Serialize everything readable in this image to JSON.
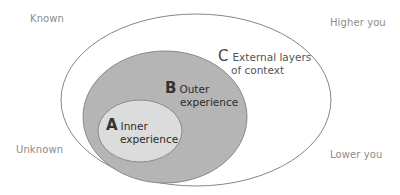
{
  "diagram": {
    "type": "nested-ellipses",
    "colors": {
      "outer_fill": "#ffffff",
      "outer_stroke": "#777777",
      "middle_fill": "#b5b5b5",
      "middle_stroke": "#8a8a8a",
      "inner_fill": "#dcdcdc",
      "inner_stroke": "#8a8a8a"
    },
    "corners": {
      "top_left": "Known",
      "bottom_left": "Unknown",
      "top_right": "Higher you",
      "bottom_right": "Lower you"
    },
    "layers": [
      {
        "letter": "A",
        "line1": "Inner",
        "line2": "experience"
      },
      {
        "letter": "B",
        "line1": "Outer",
        "line2": "experience"
      },
      {
        "letter": "C",
        "line1": "External layers",
        "line2": "of context"
      }
    ]
  }
}
